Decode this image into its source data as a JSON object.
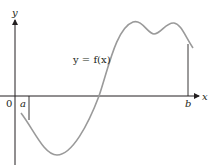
{
  "diagram": {
    "type": "function-graph",
    "axes": {
      "x_label": "x",
      "y_label": "y",
      "origin_label": "0"
    },
    "function_label": "y = f(x)",
    "interval": {
      "a_label": "a",
      "b_label": "b"
    },
    "colors": {
      "axes": "#231f20",
      "curve": "#9a9a9a",
      "text": "#231f20"
    }
  }
}
